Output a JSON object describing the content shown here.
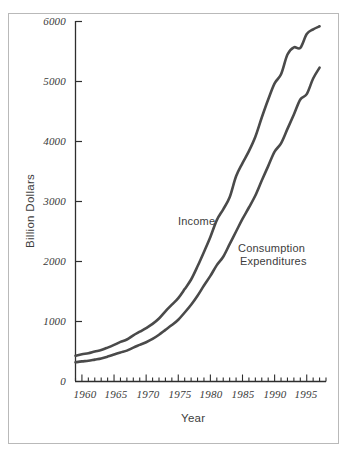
{
  "chart_data": {
    "type": "line",
    "title": "",
    "xlabel": "Year",
    "ylabel": "Billion Dollars",
    "xlim": [
      1959,
      1998
    ],
    "ylim": [
      0,
      6000
    ],
    "grid": false,
    "legend_position": "inline-annotations",
    "y_ticks": [
      0,
      1000,
      2000,
      3000,
      4000,
      5000,
      6000
    ],
    "y_tick_labels": [
      "0",
      "1000",
      "2000",
      "3000",
      "4000",
      "5000",
      "6000"
    ],
    "x_ticks": [
      1960,
      1965,
      1970,
      1975,
      1980,
      1985,
      1990,
      1995
    ],
    "x_tick_labels": [
      "1960",
      "1965",
      "1970",
      "1975",
      "1980",
      "1985",
      "1990",
      "1995"
    ],
    "x_minor_tick_interval": 1,
    "line_color": "#4a4a4a",
    "line_width": 2.6,
    "x": [
      1959,
      1960,
      1961,
      1962,
      1963,
      1964,
      1965,
      1966,
      1967,
      1968,
      1969,
      1970,
      1971,
      1972,
      1973,
      1974,
      1975,
      1976,
      1977,
      1978,
      1979,
      1980,
      1981,
      1982,
      1983,
      1984,
      1985,
      1986,
      1987,
      1988,
      1989,
      1990,
      1991,
      1992,
      1993,
      1994,
      1995,
      1996,
      1997
    ],
    "series": [
      {
        "name": "Income",
        "label": "Income",
        "color": "#4a4a4a",
        "values": [
          430,
          455,
          470,
          500,
          525,
          565,
          610,
          660,
          700,
          770,
          830,
          890,
          960,
          1050,
          1170,
          1280,
          1390,
          1540,
          1700,
          1920,
          2160,
          2410,
          2690,
          2870,
          3070,
          3420,
          3640,
          3840,
          4080,
          4400,
          4700,
          4970,
          5120,
          5450,
          5570,
          5560,
          5790,
          5870,
          5920
        ]
      },
      {
        "name": "Consumption Expenditures",
        "label": "Consumption\nExpenditures",
        "color": "#4a4a4a",
        "values": [
          320,
          335,
          345,
          365,
          385,
          415,
          450,
          485,
          515,
          565,
          610,
          655,
          710,
          780,
          860,
          940,
          1030,
          1150,
          1280,
          1430,
          1600,
          1760,
          1940,
          2080,
          2290,
          2500,
          2710,
          2900,
          3100,
          3350,
          3590,
          3830,
          3970,
          4210,
          4450,
          4700,
          4790,
          5050,
          5230
        ]
      }
    ],
    "annotations": [
      {
        "text": "Income",
        "x": 1983,
        "y": 3000
      },
      {
        "text": "Consumption",
        "x": 1988,
        "y": 2600
      },
      {
        "text": "Expenditures",
        "x": 1988,
        "y": 2400
      }
    ]
  },
  "labels": {
    "y_axis_title": "Billion Dollars",
    "x_axis_title": "Year",
    "y_ticks": [
      "6000",
      "5000",
      "4000",
      "3000",
      "2000",
      "1000",
      "0"
    ],
    "x_ticks": [
      "1960",
      "1965",
      "1970",
      "1975",
      "1980",
      "1985",
      "1990",
      "1995"
    ],
    "income_annotation": "Income",
    "consumption_annotation_line1": "Consumption",
    "consumption_annotation_line2": "Expenditures"
  },
  "colors": {
    "line": "#4a4a4a",
    "axis": "#2e2e2e",
    "frame": "#b9b9b9",
    "text": "#3d3d3d",
    "background": "#ffffff"
  }
}
